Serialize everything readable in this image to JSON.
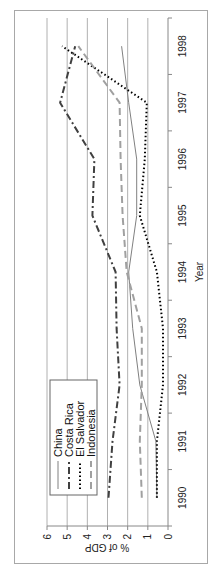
{
  "chart_data": {
    "type": "line",
    "title": "",
    "xlabel": "Year",
    "ylabel": "% of GDP",
    "ylim": [
      0,
      6
    ],
    "yticks": [
      0,
      1,
      2,
      3,
      4,
      5,
      6
    ],
    "grid": "horizontal major gridlines",
    "legend_position": "inside, upper left",
    "x": [
      "1990",
      "1991",
      "1992",
      "1993",
      "1994",
      "1995",
      "1996",
      "1997",
      "1998"
    ],
    "series": [
      {
        "name": "China",
        "style": "solid",
        "color": "#808080",
        "values": [
          0.55,
          0.6,
          1.4,
          1.75,
          1.95,
          1.55,
          1.55,
          1.95,
          2.3
        ]
      },
      {
        "name": "Costa Rica",
        "style": "dash-dot",
        "color": "#404040",
        "values": [
          2.95,
          2.75,
          2.4,
          2.55,
          2.6,
          3.75,
          3.65,
          5.35,
          4.6
        ]
      },
      {
        "name": "El Salvador",
        "style": "dotted",
        "color": "#000000",
        "values": [
          0.55,
          0.55,
          0.25,
          0.25,
          0.55,
          1.4,
          1.15,
          1.05,
          5.25
        ]
      },
      {
        "name": "Indonesia",
        "style": "dashed",
        "color": "#a0a0a0",
        "values": [
          1.3,
          1.4,
          1.3,
          1.3,
          2.05,
          2.25,
          2.35,
          2.4,
          4.45
        ]
      }
    ],
    "orientation": "rotated 90 degrees counter-clockwise"
  },
  "legend": {
    "items": [
      "China",
      "Costa Rica",
      "El Salvador",
      "Indonesia"
    ]
  },
  "axes": {
    "x_title": "Year",
    "y_title": "% of GDP",
    "x_ticks": [
      "1990",
      "1991",
      "1992",
      "1993",
      "1994",
      "1995",
      "1996",
      "1997",
      "1998"
    ],
    "y_ticks": [
      "0",
      "1",
      "2",
      "3",
      "4",
      "5",
      "6"
    ]
  }
}
